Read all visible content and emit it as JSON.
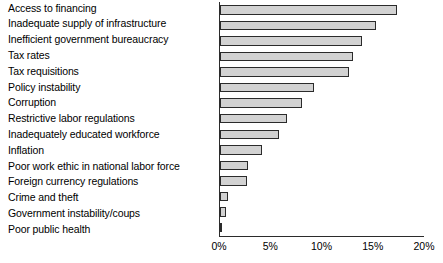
{
  "chart_data": {
    "type": "bar",
    "orientation": "horizontal",
    "title": "",
    "subtitle": "",
    "xlabel": "",
    "ylabel": "",
    "xlim": [
      0,
      20
    ],
    "xticks": [
      0,
      5,
      10,
      15,
      20
    ],
    "xtick_labels": [
      "0%",
      "5%",
      "10%",
      "15%",
      "20%"
    ],
    "grid": false,
    "legend": false,
    "value_unit": "%",
    "bar_fill_color": "#d2d2d2",
    "bar_border_color": "#2b2b2b",
    "axis_color": "#2b2b2b",
    "categories": [
      "Access to financing",
      "Inadequate supply of infrastructure",
      "Inefficient government bureaucracy",
      "Tax rates",
      "Tax requisitions",
      "Policy instability",
      "Corruption",
      "Restrictive labor regulations",
      "Inadequately educated workforce",
      "Inflation",
      "Poor work ethic in national labor force",
      "Foreign currency regulations",
      "Crime and theft",
      "Government instability/coups",
      "Poor public health"
    ],
    "values": [
      17.3,
      15.2,
      13.9,
      13.0,
      12.6,
      9.2,
      8.0,
      6.5,
      5.8,
      4.1,
      2.7,
      2.6,
      0.8,
      0.6,
      0.2
    ]
  }
}
